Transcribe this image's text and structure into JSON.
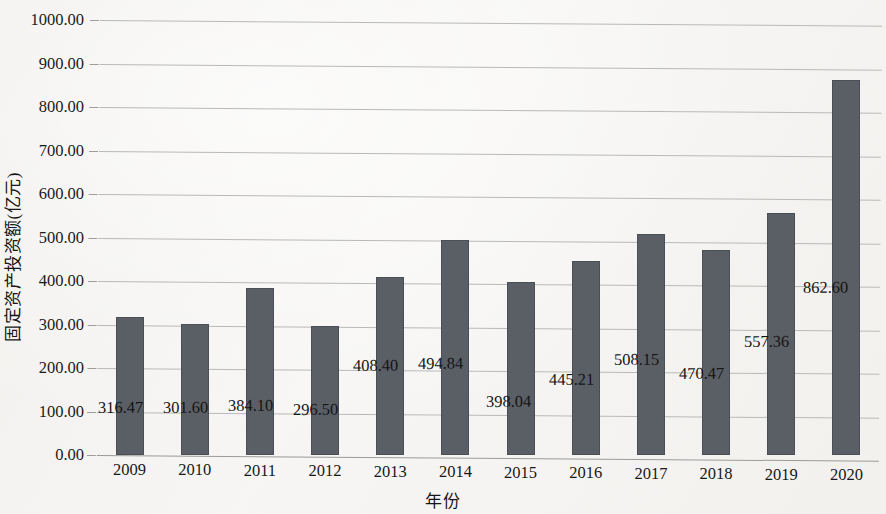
{
  "chart_data": {
    "type": "bar",
    "title": "",
    "subtitle": "",
    "xlabel": "年份",
    "ylabel": "固定资产投资额(亿元)",
    "categories": [
      "2009",
      "2010",
      "2011",
      "2012",
      "2013",
      "2014",
      "2015",
      "2016",
      "2017",
      "2018",
      "2019",
      "2020"
    ],
    "values": [
      316.47,
      301.6,
      384.1,
      296.5,
      408.4,
      494.84,
      398.04,
      445.21,
      508.15,
      470.47,
      557.36,
      862.6
    ],
    "data_labels": [
      "316.47",
      "301.60",
      "384.10",
      "296.50",
      "408.40",
      "494.84",
      "398.04",
      "445.21",
      "508.15",
      "470.47",
      "557.36",
      "862.60"
    ],
    "series": [
      {
        "name": "固定资产投资额(亿元)",
        "values": [
          316.47,
          301.6,
          384.1,
          296.5,
          408.4,
          494.84,
          398.04,
          445.21,
          508.15,
          470.47,
          557.36,
          862.6
        ]
      }
    ],
    "ylim": [
      0,
      1000
    ],
    "ytick_values": [
      0,
      100,
      200,
      300,
      400,
      500,
      600,
      700,
      800,
      900,
      1000
    ],
    "ytick_labels": [
      "0.00",
      "100.00",
      "200.00",
      "300.00",
      "400.00",
      "500.00",
      "600.00",
      "700.00",
      "800.00",
      "900.00",
      "1000.00"
    ],
    "grid": true,
    "grid_axis": "y",
    "legend": false,
    "legend_position": "none",
    "bar_color": "#5a5f66",
    "gridline_color": "#b9b9b7",
    "background_color": "#f6f5f3",
    "text_color": "#1a1a1a"
  }
}
